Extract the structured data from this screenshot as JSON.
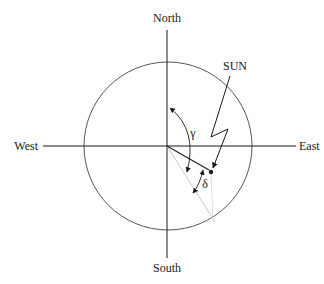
{
  "diagram": {
    "type": "solar-geometry-compass",
    "labels": {
      "north": "North",
      "south": "South",
      "east": "East",
      "west": "West",
      "sun": "SUN",
      "gamma": "γ",
      "delta": "δ"
    },
    "colors": {
      "stroke": "#1a1a1a",
      "circle": "#555555",
      "projection": "#c8c8c8",
      "background": "#ffffff"
    },
    "geometry": {
      "center": [
        168,
        146
      ],
      "radius": 84
    }
  }
}
